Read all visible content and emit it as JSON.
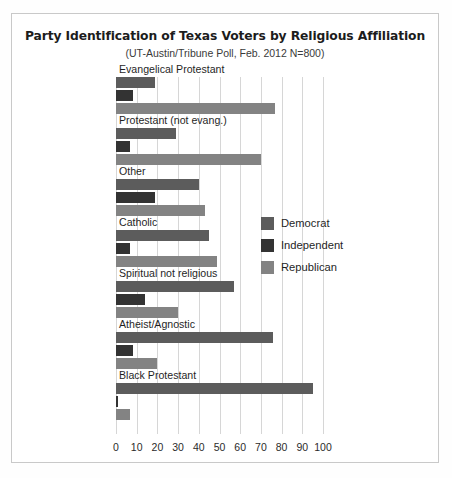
{
  "chart_data": {
    "type": "bar",
    "orientation": "horizontal",
    "title": "Party Identification of Texas Voters by Religious Affiliation",
    "subtitle": "(UT-Austin/Tribune Poll, Feb. 2012 N=800)",
    "xlabel": "",
    "ylabel": "",
    "xlim": [
      0,
      100
    ],
    "xticks": [
      0,
      10,
      20,
      30,
      40,
      50,
      60,
      70,
      80,
      90,
      100
    ],
    "grid": true,
    "legend_position": "center-right",
    "categories": [
      "Evangelical Protestant",
      "Protestant (not evang.)",
      "Other",
      "Catholic",
      "Spiritual not religious",
      "Atheist/Agnostic",
      "Black Protestant"
    ],
    "series": [
      {
        "name": "Democrat",
        "color": "#5c5c5c",
        "values": [
          19,
          29,
          40,
          45,
          57,
          76,
          95
        ]
      },
      {
        "name": "Independent",
        "color": "#333333",
        "values": [
          8,
          7,
          19,
          7,
          14,
          8,
          1
        ]
      },
      {
        "name": "Republican",
        "color": "#838383",
        "values": [
          77,
          70,
          43,
          49,
          30,
          20,
          7
        ]
      }
    ]
  },
  "legend": {
    "items": [
      {
        "label": "Democrat"
      },
      {
        "label": "Independent"
      },
      {
        "label": "Republican"
      }
    ]
  }
}
